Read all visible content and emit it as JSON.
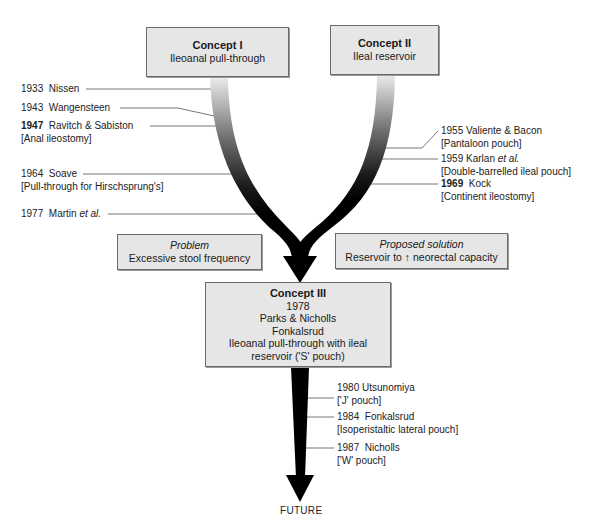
{
  "concepts": {
    "concept1": {
      "title": "Concept I",
      "subtitle": "Ileoanal pull-through"
    },
    "concept2": {
      "title": "Concept II",
      "subtitle": "Ileal reservoir"
    },
    "concept3": {
      "title": "Concept III",
      "year": "1978",
      "authors1": "Parks & Nicholls",
      "authors2": "Fonkalsrud",
      "desc1": "Ileoanal pull-through with ileal",
      "desc2": "reservoir ('S' pouch)"
    }
  },
  "problem": {
    "heading": "Problem",
    "text": "Excessive stool frequency"
  },
  "solution": {
    "heading": "Proposed solution",
    "text": "Reservoir to ↑ neorectal capacity"
  },
  "left_milestones": [
    {
      "year": "1933",
      "name": "Nissen",
      "note": "",
      "bold_year": false
    },
    {
      "year": "1943",
      "name": "Wangensteen",
      "note": "",
      "bold_year": false
    },
    {
      "year": "1947",
      "name": "Ravitch & Sabiston",
      "note": "[Anal ileostomy]",
      "bold_year": true
    },
    {
      "year": "1964",
      "name": "Soave",
      "note": "[Pull-through for Hirschsprung's]",
      "bold_year": false
    },
    {
      "year": "1977",
      "name": "Martin",
      "name_italic": "et al.",
      "note": "",
      "bold_year": false
    }
  ],
  "right_milestones": [
    {
      "year": "1955",
      "name": "Valiente & Bacon",
      "note": "[Pantaloon pouch]",
      "bold_year": false
    },
    {
      "year": "1959",
      "name": "Karlan",
      "name_italic": "et al.",
      "note": "[Double-barrelled ileal pouch]",
      "bold_year": false
    },
    {
      "year": "1969",
      "name": "Kock",
      "note": "[Continent ileostomy]",
      "bold_year": true
    }
  ],
  "future_milestones": [
    {
      "year": "1980",
      "name": "Utsunomiya",
      "note": "['J' pouch]"
    },
    {
      "year": "1984",
      "name": "Fonkalsrud",
      "note": "[Isoperistaltic lateral pouch]"
    },
    {
      "year": "1987",
      "name": "Nicholls",
      "note": "['W' pouch]"
    }
  ],
  "future_label": "FUTURE",
  "colors": {
    "box_fill": "#e6e6e6",
    "band_start": "#e8e8e8",
    "band_end": "#000000"
  }
}
